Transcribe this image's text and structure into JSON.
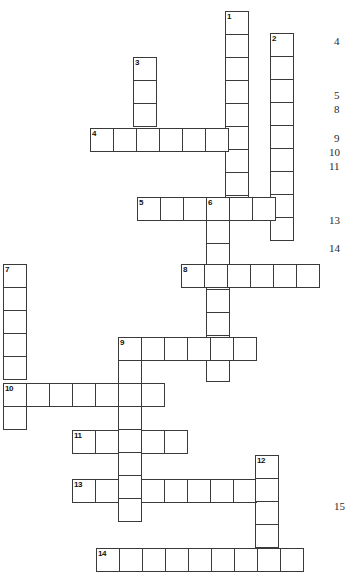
{
  "puzzle": {
    "type": "crossword-grid",
    "title": "Crossword Puzzle Grid",
    "cell_size": 23.5,
    "grid_color": "#3a3a3a",
    "cell_fill": "#ffffff",
    "background": "#ffffff",
    "entries": [
      {
        "number": "1",
        "direction": "down",
        "length": 9,
        "col": 9.6,
        "row": 0.47
      },
      {
        "number": "2",
        "direction": "down",
        "length": 9,
        "col": 11.5,
        "row": 1.4
      },
      {
        "number": "3",
        "direction": "down",
        "length": 4,
        "col": 5.66,
        "row": 2.42
      },
      {
        "number": "4",
        "direction": "across",
        "length": 7,
        "col": 3.83,
        "row": 5.45
      },
      {
        "number": "5",
        "direction": "across",
        "length": 7,
        "col": 5.83,
        "row": 8.38
      },
      {
        "number": "6",
        "direction": "down",
        "length": 8,
        "col": 8.72,
        "row": 8.38
      },
      {
        "number": "7",
        "direction": "down",
        "length": 6,
        "col": 0.13,
        "row": 11.23
      },
      {
        "number": "8",
        "direction": "across",
        "length": 6,
        "col": 7.7,
        "row": 11.23
      },
      {
        "number": "9",
        "direction": "across",
        "length": 6,
        "col": 5.02,
        "row": 14.34
      },
      {
        "number": "9b",
        "direction": "down",
        "length": 8,
        "col": 5.02,
        "row": 14.34
      },
      {
        "number": "10",
        "direction": "across",
        "length": 7,
        "col": 0.13,
        "row": 16.3
      },
      {
        "number": "11",
        "direction": "across",
        "length": 5,
        "col": 3.06,
        "row": 18.3
      },
      {
        "number": "12",
        "direction": "down",
        "length": 5,
        "col": 10.85,
        "row": 19.36
      },
      {
        "number": "13",
        "direction": "across",
        "length": 9,
        "col": 3.06,
        "row": 20.38
      },
      {
        "number": "14",
        "direction": "across",
        "length": 9,
        "col": 4.08,
        "row": 23.32
      }
    ],
    "cells": [
      {
        "x": 225,
        "y": 11,
        "num": "1"
      },
      {
        "x": 225,
        "y": 34
      },
      {
        "x": 225,
        "y": 57
      },
      {
        "x": 225,
        "y": 80
      },
      {
        "x": 225,
        "y": 103
      },
      {
        "x": 225,
        "y": 126
      },
      {
        "x": 225,
        "y": 149
      },
      {
        "x": 225,
        "y": 172
      },
      {
        "x": 225,
        "y": 195
      },
      {
        "x": 270,
        "y": 33,
        "num": "2"
      },
      {
        "x": 270,
        "y": 56
      },
      {
        "x": 270,
        "y": 79
      },
      {
        "x": 270,
        "y": 102
      },
      {
        "x": 270,
        "y": 125
      },
      {
        "x": 270,
        "y": 148
      },
      {
        "x": 270,
        "y": 171
      },
      {
        "x": 270,
        "y": 194
      },
      {
        "x": 270,
        "y": 217
      },
      {
        "x": 133,
        "y": 57,
        "num": "3"
      },
      {
        "x": 133,
        "y": 80
      },
      {
        "x": 133,
        "y": 103
      },
      {
        "x": 90,
        "y": 128,
        "num": "4"
      },
      {
        "x": 113,
        "y": 128
      },
      {
        "x": 136,
        "y": 128
      },
      {
        "x": 159,
        "y": 128
      },
      {
        "x": 182,
        "y": 128
      },
      {
        "x": 205,
        "y": 128
      },
      {
        "x": 137,
        "y": 197,
        "num": "5"
      },
      {
        "x": 160,
        "y": 197
      },
      {
        "x": 183,
        "y": 197
      },
      {
        "x": 206,
        "y": 197,
        "num": "6"
      },
      {
        "x": 229,
        "y": 197
      },
      {
        "x": 252,
        "y": 197
      },
      {
        "x": 206,
        "y": 220
      },
      {
        "x": 206,
        "y": 243
      },
      {
        "x": 206,
        "y": 266
      },
      {
        "x": 206,
        "y": 289
      },
      {
        "x": 206,
        "y": 312
      },
      {
        "x": 206,
        "y": 335
      },
      {
        "x": 206,
        "y": 358
      },
      {
        "x": 3,
        "y": 264,
        "num": "7"
      },
      {
        "x": 3,
        "y": 287
      },
      {
        "x": 3,
        "y": 310
      },
      {
        "x": 3,
        "y": 333
      },
      {
        "x": 3,
        "y": 356
      },
      {
        "x": 181,
        "y": 264,
        "num": "8"
      },
      {
        "x": 204,
        "y": 264
      },
      {
        "x": 227,
        "y": 264
      },
      {
        "x": 250,
        "y": 264
      },
      {
        "x": 273,
        "y": 264
      },
      {
        "x": 296,
        "y": 264
      },
      {
        "x": 118,
        "y": 337,
        "num": "9"
      },
      {
        "x": 141,
        "y": 337
      },
      {
        "x": 164,
        "y": 337
      },
      {
        "x": 187,
        "y": 337
      },
      {
        "x": 210,
        "y": 337
      },
      {
        "x": 233,
        "y": 337
      },
      {
        "x": 118,
        "y": 360
      },
      {
        "x": 118,
        "y": 383
      },
      {
        "x": 118,
        "y": 406
      },
      {
        "x": 118,
        "y": 429
      },
      {
        "x": 118,
        "y": 452
      },
      {
        "x": 118,
        "y": 475
      },
      {
        "x": 118,
        "y": 498
      },
      {
        "x": 3,
        "y": 383,
        "num": "10"
      },
      {
        "x": 26,
        "y": 383
      },
      {
        "x": 49,
        "y": 383
      },
      {
        "x": 72,
        "y": 383
      },
      {
        "x": 95,
        "y": 383
      },
      {
        "x": 141,
        "y": 383
      },
      {
        "x": 3,
        "y": 406
      },
      {
        "x": 72,
        "y": 430,
        "num": "11"
      },
      {
        "x": 95,
        "y": 430
      },
      {
        "x": 141,
        "y": 430
      },
      {
        "x": 164,
        "y": 430
      },
      {
        "x": 255,
        "y": 455,
        "num": "12"
      },
      {
        "x": 255,
        "y": 501
      },
      {
        "x": 255,
        "y": 524
      },
      {
        "x": 72,
        "y": 479,
        "num": "13"
      },
      {
        "x": 95,
        "y": 479
      },
      {
        "x": 141,
        "y": 479
      },
      {
        "x": 164,
        "y": 479
      },
      {
        "x": 187,
        "y": 479
      },
      {
        "x": 210,
        "y": 479
      },
      {
        "x": 233,
        "y": 479
      },
      {
        "x": 255,
        "y": 478
      },
      {
        "x": 96,
        "y": 548,
        "num": "14"
      },
      {
        "x": 119,
        "y": 548
      },
      {
        "x": 142,
        "y": 548
      },
      {
        "x": 165,
        "y": 548
      },
      {
        "x": 188,
        "y": 548
      },
      {
        "x": 211,
        "y": 548
      },
      {
        "x": 234,
        "y": 548
      },
      {
        "x": 257,
        "y": 548
      },
      {
        "x": 280,
        "y": 548
      }
    ],
    "clue_numbers": [
      {
        "label": "4",
        "x": 334,
        "y": 36
      },
      {
        "label": "5",
        "x": 334,
        "y": 90
      },
      {
        "label": "8",
        "x": 334,
        "y": 104
      },
      {
        "label": "9",
        "x": 334,
        "y": 133
      },
      {
        "label": "10",
        "x": 329,
        "y": 147
      },
      {
        "label": "11",
        "x": 329,
        "y": 161
      },
      {
        "label": "13",
        "x": 329,
        "y": 215
      },
      {
        "label": "14",
        "x": 329,
        "y": 243
      },
      {
        "label": "15",
        "x": 334,
        "y": 501
      }
    ]
  }
}
